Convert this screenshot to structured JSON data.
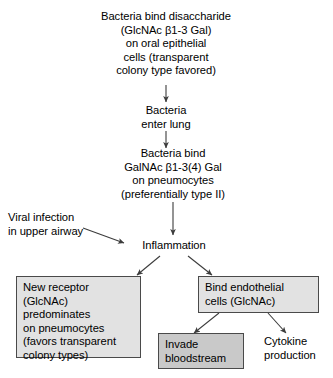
{
  "diagram": {
    "colors": {
      "background": "#ffffff",
      "text": "#000000",
      "stroke": "#3c3c3c",
      "box_border": "#4a4a4a",
      "fill_light": "#e2e2e2",
      "fill_dark": "#c9c9c9"
    },
    "nodes": [
      {
        "id": "bind-disaccharide",
        "name": "node-bacteria-bind-disaccharide",
        "text": "Bacteria bind disaccharide\n(GlcNAc β1-3 Gal)\non oral epithelial\ncells (transparent\ncolony type favored)",
        "style": "plain-center"
      },
      {
        "id": "enter-lung",
        "name": "node-bacteria-enter-lung",
        "text": "Bacteria\nenter lung",
        "style": "plain-center"
      },
      {
        "id": "bind-galnac",
        "name": "node-bacteria-bind-galnac",
        "text": "Bacteria bind\nGalNAc β1-3(4) Gal\non pneumocytes\n(preferentially type II)",
        "style": "plain-center"
      },
      {
        "id": "viral-infection",
        "name": "node-viral-infection",
        "text": "Viral infection\nin upper airway",
        "style": "plain-left"
      },
      {
        "id": "inflammation",
        "name": "node-inflammation",
        "text": "Inflammation",
        "style": "plain-center"
      },
      {
        "id": "new-receptor",
        "name": "node-new-receptor",
        "text": "New receptor\n(GlcNAc)\npredominates\non pneumocytes\n(favors transparent\ncolony types)",
        "style": "boxed-light"
      },
      {
        "id": "bind-endothelial",
        "name": "node-bind-endothelial-cells",
        "text": "Bind endothelial\ncells (GlcNAc)",
        "style": "boxed-light"
      },
      {
        "id": "invade-bloodstream",
        "name": "node-invade-bloodstream",
        "text": "Invade\nbloodstream",
        "style": "boxed-dark"
      },
      {
        "id": "cytokine-production",
        "name": "node-cytokine-production",
        "text": "Cytokine\nproduction",
        "style": "plain-left"
      }
    ],
    "edges": [
      {
        "name": "arrow-disaccharide-to-enter-lung",
        "from": "bind-disaccharide",
        "to": "enter-lung",
        "kind": "vertical"
      },
      {
        "name": "arrow-enter-lung-to-galnac",
        "from": "enter-lung",
        "to": "bind-galnac",
        "kind": "vertical"
      },
      {
        "name": "arrow-galnac-to-inflammation",
        "from": "bind-galnac",
        "to": "inflammation",
        "kind": "vertical"
      },
      {
        "name": "arrow-viral-infection-to-inflammation",
        "from": "viral-infection",
        "to": "inflammation",
        "kind": "diagonal"
      },
      {
        "name": "arrow-inflammation-to-new-receptor",
        "from": "inflammation",
        "to": "new-receptor",
        "kind": "diagonal"
      },
      {
        "name": "arrow-inflammation-to-bind-endothelial",
        "from": "inflammation",
        "to": "bind-endothelial",
        "kind": "diagonal"
      },
      {
        "name": "arrow-endothelial-to-invade",
        "from": "bind-endothelial",
        "to": "invade-bloodstream",
        "kind": "diagonal"
      },
      {
        "name": "arrow-endothelial-to-cytokine",
        "from": "bind-endothelial",
        "to": "cytokine-production",
        "kind": "diagonal"
      }
    ]
  }
}
